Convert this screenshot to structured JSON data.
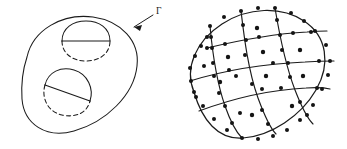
{
  "figure": {
    "caption_visible": false,
    "background_color": "#ffffff",
    "ink_color": "#1b1b1b",
    "panels": [
      {
        "id": "left",
        "name": "domain-with-two-holes",
        "description": "Smooth closed outer curve (tilted ellipse) enclosing two smaller closed curves; each small curve has a chord with one arc solid and the other arc dashed.",
        "labels": [
          {
            "name": "boundary-label-gamma",
            "text": "Γ",
            "x": 158,
            "y": 13,
            "points_to": "outer-boundary-curve"
          }
        ],
        "leader_arrow": {
          "name": "gamma-leader-arrow",
          "from_x": 153,
          "from_y": 16,
          "to_x": 134,
          "to_y": 28
        },
        "outer_boundary": {
          "name": "outer-boundary-curve",
          "shape": "ellipse",
          "center_x": 80,
          "center_y": 75,
          "radius_x": 64,
          "radius_y": 48,
          "rotation_deg": -28,
          "line_style": "solid"
        },
        "holes": [
          {
            "name": "upper-hole",
            "center_x": 86,
            "center_y": 41,
            "radius_x": 24,
            "radius_y": 19,
            "rotation_deg": 0,
            "chord_orientation": "horizontal",
            "solid_arc": "upper",
            "dashed_arc": "lower"
          },
          {
            "name": "lower-hole",
            "center_x": 67,
            "center_y": 92,
            "radius_x": 25,
            "radius_y": 23,
            "rotation_deg": -22,
            "chord_orientation": "diagonal",
            "solid_arc": "upper-right",
            "dashed_arc": "lower-left"
          }
        ]
      },
      {
        "id": "right",
        "name": "finite-element-mesh-on-ellipse",
        "description": "Tilted elliptical domain discretized by a curvilinear quadrilateral mesh; black dots mark element corner nodes, edge mid-side nodes and element centre nodes (nine-node elements).",
        "domain": {
          "name": "mesh-boundary-ellipse",
          "center_x": 86,
          "center_y": 75,
          "radius_x": 62,
          "radius_y": 46,
          "rotation_deg": -34
        },
        "grid": {
          "rows": 4,
          "columns": 4,
          "node_type": "nine-node-quadratic",
          "node_radius": 2.0,
          "node_color": "#141414"
        }
      }
    ]
  },
  "mesh_nodes": {
    "corner_and_edge_count": 40,
    "centre_count": 11
  }
}
